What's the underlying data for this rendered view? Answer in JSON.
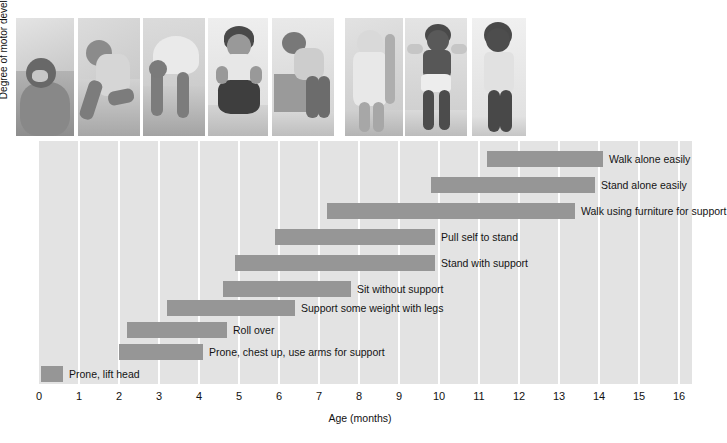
{
  "figure": {
    "y_axis_label": "Degree of motor development",
    "x_axis_label": "Age (months)"
  },
  "photos": [
    {
      "name": "photo-prone-lift-head",
      "caption": "infant lying prone lifting head"
    },
    {
      "name": "photo-roll-over",
      "caption": "infant rolling over"
    },
    {
      "name": "photo-prone-chest-up",
      "caption": "infant on hands and feet, chest up"
    },
    {
      "name": "photo-sit-without-support",
      "caption": "infant sitting without support"
    },
    {
      "name": "photo-pull-self-to-stand",
      "caption": "infant pulling self up on a box"
    },
    {
      "name": "photo-stand-with-support",
      "caption": "infant standing with support"
    },
    {
      "name": "photo-walk-with-help",
      "caption": "toddler walking holding adult hands"
    },
    {
      "name": "photo-walk-alone",
      "caption": "toddler walking alone"
    }
  ],
  "chart_data": {
    "type": "bar",
    "orientation": "horizontal-range",
    "title": "",
    "xlabel": "Age (months)",
    "ylabel": "Degree of motor development",
    "xlim": [
      0,
      16
    ],
    "xticks": [
      0,
      1,
      2,
      3,
      4,
      5,
      6,
      7,
      8,
      9,
      10,
      11,
      12,
      13,
      14,
      15,
      16
    ],
    "grid": "vertical",
    "legend": "none",
    "bar_color": "#969696",
    "plot_background": "#e3e3e3",
    "categories": [
      "Walk alone easily",
      "Stand alone easily",
      "Walk using furniture for support",
      "Pull self to stand",
      "Stand with support",
      "Sit without support",
      "Support some weight with legs",
      "Roll over",
      "Prone, chest up, use arms for support",
      "Prone, lift head"
    ],
    "ranges": [
      {
        "label": "Walk alone easily",
        "start": 11.2,
        "end": 14.1
      },
      {
        "label": "Stand alone easily",
        "start": 9.8,
        "end": 13.9
      },
      {
        "label": "Walk using furniture for support",
        "start": 7.2,
        "end": 13.4
      },
      {
        "label": "Pull self to stand",
        "start": 5.9,
        "end": 9.9
      },
      {
        "label": "Stand with support",
        "start": 4.9,
        "end": 9.9
      },
      {
        "label": "Sit without support",
        "start": 4.6,
        "end": 7.8
      },
      {
        "label": "Support some weight with legs",
        "start": 3.2,
        "end": 6.4
      },
      {
        "label": "Roll over",
        "start": 2.2,
        "end": 4.7
      },
      {
        "label": "Prone, chest up, use arms for support",
        "start": 2.0,
        "end": 4.1
      },
      {
        "label": "Prone, lift head",
        "start": 0.05,
        "end": 0.6
      }
    ]
  }
}
